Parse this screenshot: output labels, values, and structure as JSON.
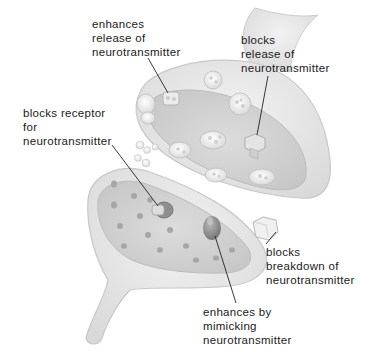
{
  "diagram": {
    "labels": [
      {
        "id": "enhances-release",
        "lines": [
          "enhances",
          "release of",
          "neurotransmitter"
        ]
      },
      {
        "id": "blocks-release",
        "lines": [
          "blocks",
          "release of",
          "neurotransmitter"
        ]
      },
      {
        "id": "blocks-receptor",
        "lines": [
          "blocks receptor",
          "for",
          "neurotransmitter"
        ]
      },
      {
        "id": "blocks-breakdown",
        "lines": [
          "blocks",
          "breakdown of",
          "neurotransmitter"
        ]
      },
      {
        "id": "enhances-mimicking",
        "lines": [
          "enhances by",
          "mimicking",
          "neurotransmitter"
        ]
      }
    ],
    "colors": {
      "membrane": "#e6e6e6",
      "membrane_edge": "#c8c8c8",
      "inner": "#d2d2d2",
      "vesicle": "#f4f4f4",
      "pore": "#a8a8a8",
      "leader_line": "#222222",
      "text": "#1a1a1a"
    }
  }
}
